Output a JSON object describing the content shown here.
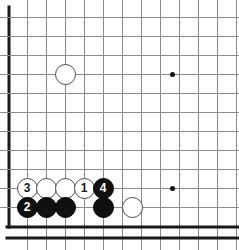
{
  "diagram": {
    "board_color": "#ffffff",
    "line_color": "#8a8a8a",
    "edge_color": "#1a1a1a",
    "black_stone_color": "#101010",
    "white_stone_color": "#ffffff",
    "grid": {
      "spacing_px": 19,
      "origin_x": 8,
      "origin_y": 17,
      "columns": 13,
      "rows": 12,
      "left_edge_is_border": true,
      "bottom_edge_is_border": true,
      "top_edge_is_border": false,
      "right_edge_is_border": false
    },
    "star_points": [
      {
        "name": "star-point-upper",
        "x": 172,
        "y": 74
      },
      {
        "name": "star-point-lower",
        "x": 172,
        "y": 188
      }
    ],
    "stones": [
      {
        "id": "white-corner-approach",
        "color": "white",
        "label": "",
        "x": 65,
        "y": 74
      },
      {
        "id": "white-3",
        "color": "white",
        "label": "3",
        "x": 27,
        "y": 188
      },
      {
        "id": "white-a",
        "color": "white",
        "label": "",
        "x": 46,
        "y": 188
      },
      {
        "id": "white-b",
        "color": "white",
        "label": "",
        "x": 65,
        "y": 188
      },
      {
        "id": "white-1",
        "color": "white",
        "label": "1",
        "x": 84,
        "y": 188
      },
      {
        "id": "black-4",
        "color": "black",
        "label": "4",
        "x": 103,
        "y": 188
      },
      {
        "id": "black-2",
        "color": "black",
        "label": "2",
        "x": 27,
        "y": 207
      },
      {
        "id": "black-c",
        "color": "black",
        "label": "",
        "x": 46,
        "y": 207
      },
      {
        "id": "black-d",
        "color": "black",
        "label": "",
        "x": 65,
        "y": 207
      },
      {
        "id": "black-e",
        "color": "black",
        "label": "",
        "x": 103,
        "y": 207
      },
      {
        "id": "white-f",
        "color": "white",
        "label": "",
        "x": 132,
        "y": 207
      }
    ],
    "move_numbers": [
      "1",
      "2",
      "3",
      "4"
    ]
  }
}
